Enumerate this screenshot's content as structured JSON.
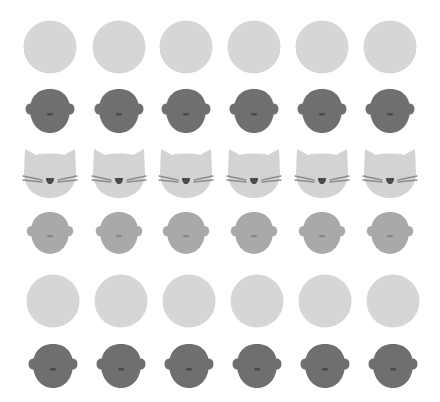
{
  "colors": {
    "background": "#ffffff",
    "circle": "#d6d6d6",
    "head_dark": "#6f6f6f",
    "head_light": "#a9a9a9",
    "cat": "#d3d3d3",
    "whisker": "#8c8c8c",
    "cat_nose": "#4a4a4a",
    "head_mouth_dark": "#4a4a4a",
    "head_mouth_light": "#888888"
  },
  "rows": [
    {
      "type": "circle",
      "icon": "circle-icon",
      "cy": 47,
      "cx": [
        50,
        119,
        186,
        254,
        322,
        390
      ]
    },
    {
      "type": "head-dark",
      "icon": "head-icon",
      "cy": 111,
      "cx": [
        50,
        119,
        186,
        254,
        322,
        390
      ]
    },
    {
      "type": "cat",
      "icon": "cat-face-icon",
      "cy": 173,
      "cx": [
        50,
        119,
        186,
        254,
        322,
        390
      ]
    },
    {
      "type": "head-light",
      "icon": "head-icon",
      "cy": 233,
      "cx": [
        50,
        119,
        186,
        254,
        322,
        390
      ]
    },
    {
      "type": "circle",
      "icon": "circle-icon",
      "cy": 301,
      "cx": [
        53,
        121,
        189,
        257,
        325,
        393
      ]
    },
    {
      "type": "head-dark",
      "icon": "head-icon",
      "cy": 366,
      "cx": [
        53,
        121,
        189,
        257,
        325,
        393
      ]
    }
  ]
}
